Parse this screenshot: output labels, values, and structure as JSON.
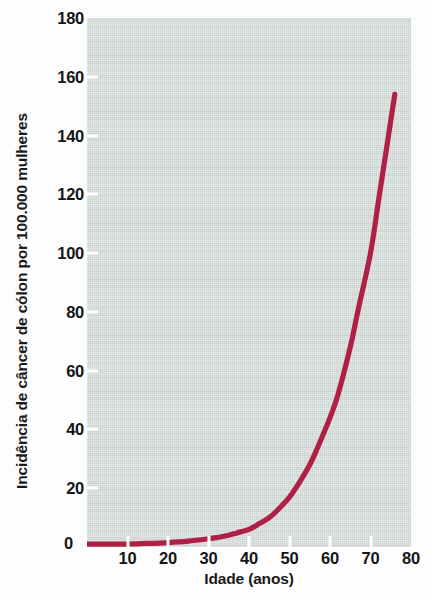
{
  "chart_data": {
    "type": "line",
    "title": "",
    "xlabel": "Idade (anos)",
    "ylabel": "Incidência de câncer de cólon por 100.000 mulheres",
    "xlim": [
      0,
      80
    ],
    "ylim": [
      0,
      180
    ],
    "grid": false,
    "legend": null,
    "xticks": [
      0,
      10,
      20,
      30,
      40,
      50,
      60,
      70,
      80
    ],
    "xtick_labels": [
      "",
      "10",
      "20",
      "30",
      "40",
      "50",
      "60",
      "70",
      "80"
    ],
    "yticks": [
      0,
      20,
      40,
      60,
      80,
      100,
      120,
      140,
      160,
      180
    ],
    "ytick_labels": [
      "0",
      "20",
      "40",
      "60",
      "80",
      "100",
      "120",
      "140",
      "160",
      "180"
    ],
    "origin_label": "0",
    "series": [
      {
        "name": "Incidência de câncer de cólon",
        "color": "#b01f45",
        "x": [
          0,
          5,
          10,
          15,
          20,
          25,
          30,
          32,
          35,
          37,
          40,
          42,
          45,
          47,
          50,
          52,
          55,
          57,
          60,
          62,
          65,
          67,
          70,
          72,
          74,
          76
        ],
        "values": [
          1,
          1,
          1,
          1.2,
          1.5,
          2,
          2.8,
          3.2,
          4,
          4.8,
          6,
          7.5,
          10,
          12.5,
          17,
          21,
          28,
          34,
          44,
          52,
          68,
          81,
          100,
          118,
          136,
          154
        ]
      }
    ]
  },
  "axes": {
    "plot_background_color": "#ccd5d2",
    "tick_color": "#ffffff",
    "text_color": "#151515"
  }
}
